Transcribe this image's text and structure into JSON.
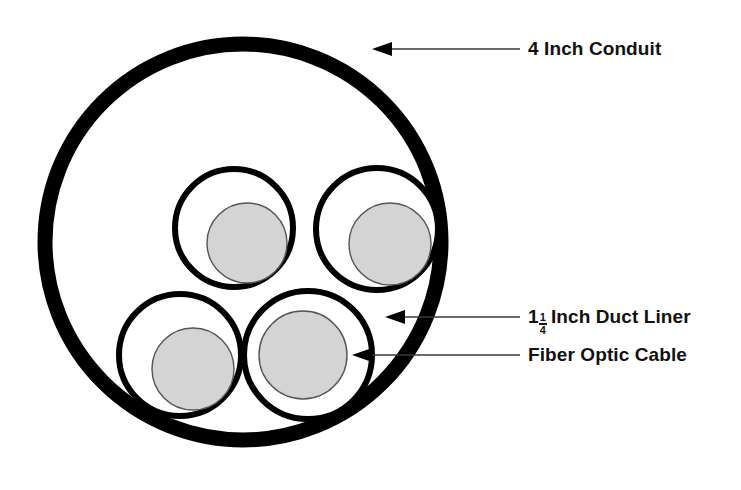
{
  "diagram": {
    "background_color": "#ffffff",
    "stroke_color": "#000000",
    "cable_fill_color": "#d4d4d4",
    "cable_outline_color": "#555555"
  },
  "labels": {
    "conduit": {
      "text": "4 Inch Conduit",
      "arrow_tip_x": 372,
      "arrow_tip_y": 49,
      "leader_end_x": 520
    },
    "duct_liner": {
      "whole": "1",
      "numerator": "1",
      "denominator": "4",
      "tail": "Inch Duct Liner",
      "full_text": "1 1/4 Inch Duct Liner",
      "arrow_tip_x": 385,
      "arrow_tip_y": 317,
      "leader_end_x": 520
    },
    "fiber_optic_cable": {
      "text": "Fiber Optic Cable",
      "arrow_tip_x": 352,
      "arrow_tip_y": 355,
      "leader_end_x": 520
    }
  },
  "geometry": {
    "conduit": {
      "cx": 243,
      "cy": 242,
      "r": 198,
      "stroke_width": 15
    },
    "duct_liners": [
      {
        "name": "top-left",
        "cx": 234,
        "cy": 228,
        "r": 59,
        "stroke_width": 6
      },
      {
        "name": "top-right",
        "cx": 377,
        "cy": 229,
        "r": 61,
        "stroke_width": 6
      },
      {
        "name": "bottom-left",
        "cx": 180,
        "cy": 355,
        "r": 61,
        "stroke_width": 6
      },
      {
        "name": "bottom-right",
        "cx": 308,
        "cy": 355,
        "r": 64,
        "stroke_width": 6
      }
    ],
    "cables": [
      {
        "name": "top-left",
        "cx": 247,
        "cy": 243,
        "r": 40
      },
      {
        "name": "top-right",
        "cx": 390,
        "cy": 244,
        "r": 41
      },
      {
        "name": "bottom-left",
        "cx": 193,
        "cy": 369,
        "r": 41
      },
      {
        "name": "bottom-right",
        "cx": 303,
        "cy": 355,
        "r": 44
      }
    ]
  }
}
